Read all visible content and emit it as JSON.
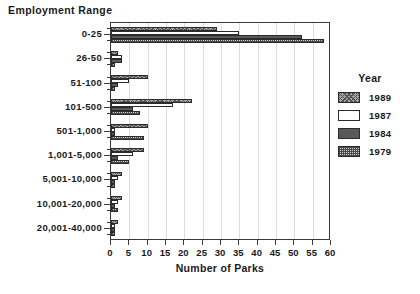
{
  "chart_data": {
    "type": "bar",
    "orientation": "horizontal",
    "title": "",
    "xlabel": "Number of Parks",
    "ylabel": "Employment Range",
    "xlim": [
      0,
      60
    ],
    "xticks": [
      0,
      5,
      10,
      15,
      20,
      25,
      30,
      35,
      40,
      45,
      50,
      55,
      60
    ],
    "xtick_labels": [
      "0",
      "5",
      "10",
      "15",
      "20",
      "25",
      "30",
      "35",
      "40",
      "45",
      "50",
      "55",
      "60"
    ],
    "grid": true,
    "grid_axis": "x",
    "legend_title": "Year",
    "legend_position": "right",
    "categories": [
      "0-25",
      "26-50",
      "51-100",
      "101-500",
      "501-1,000",
      "1,001-5,000",
      "5,001-10,000",
      "10,001-20,000",
      "20,001-40,000"
    ],
    "series": [
      {
        "name": "1989",
        "color": "#a8a8a8",
        "pattern": "crosshatch",
        "values": [
          29,
          2,
          10,
          22,
          10,
          9,
          3,
          3,
          2
        ]
      },
      {
        "name": "1987",
        "color": "#ffffff",
        "pattern": "empty",
        "values": [
          35,
          3,
          5,
          17,
          1,
          6,
          2,
          2,
          1
        ]
      },
      {
        "name": "1984",
        "color": "#595959",
        "pattern": "solid",
        "values": [
          52,
          3,
          2,
          6,
          1,
          2,
          1,
          1,
          1
        ]
      },
      {
        "name": "1979",
        "color": "#cfcfcf",
        "pattern": "dotgrid",
        "values": [
          58,
          1,
          1,
          8,
          9,
          5,
          1,
          2,
          1
        ]
      }
    ]
  },
  "legend": {
    "title": "Year",
    "entries": [
      {
        "label": "1989",
        "swatch": "crosshatch-swatch"
      },
      {
        "label": "1987",
        "swatch": "empty-swatch"
      },
      {
        "label": "1984",
        "swatch": "solid-dark-swatch"
      },
      {
        "label": "1979",
        "swatch": "dotgrid-swatch"
      }
    ]
  },
  "axes": {
    "y_axis_title": "Employment Range",
    "x_axis_title": "Number of Parks"
  }
}
